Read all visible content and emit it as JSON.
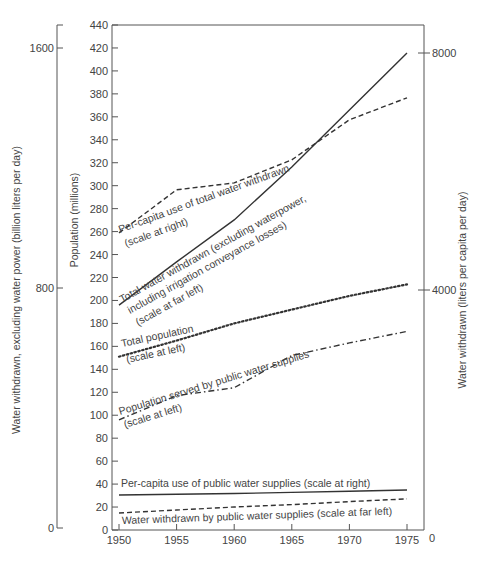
{
  "chart_data": {
    "type": "line",
    "title": "",
    "x": [
      1950,
      1955,
      1960,
      1965,
      1970,
      1975
    ],
    "xlabel": "",
    "axes": {
      "far_left": {
        "label": "Water withdrawn, excluding water power (billion liters per day)",
        "ticks": [
          0,
          800,
          1600
        ],
        "range": [
          0,
          1600
        ]
      },
      "left": {
        "label": "Population (millions)",
        "ticks": [
          0,
          20,
          40,
          60,
          80,
          100,
          120,
          140,
          160,
          180,
          200,
          220,
          240,
          260,
          280,
          300,
          320,
          340,
          360,
          380,
          400,
          420,
          440
        ],
        "range": [
          0,
          440
        ]
      },
      "right": {
        "label": "Water withdrawn (liters per capita per day)",
        "ticks": [
          0,
          4000,
          8000
        ],
        "range": [
          0,
          8000
        ]
      },
      "x_ticks": [
        "1950",
        "1955",
        "1960",
        "1965",
        "1970",
        "1975"
      ]
    },
    "grid": false,
    "series": [
      {
        "name": "Total water withdrawn (excluding waterpower, including irrigation conveyance losses)",
        "scale": "far_left",
        "style": "solid",
        "values": [
          743,
          887,
          1027,
          1203,
          1393,
          1583
        ],
        "label_lines": [
          "Total water withdrawn (excluding waterpower,",
          "including irrigation conveyance losses)",
          "(scale at far left)"
        ]
      },
      {
        "name": "Per-capita use of total water withdrawn",
        "scale": "right",
        "style": "dashed",
        "values": [
          4983,
          5705,
          5822,
          6208,
          6879,
          7248
        ],
        "label_lines": [
          "Per-capita use of total water  withdrawn",
          "(scale at right)"
        ]
      },
      {
        "name": "Total population",
        "scale": "left",
        "style": "dotted",
        "values": [
          151,
          165,
          180,
          192,
          204,
          214
        ],
        "label_lines": [
          "Total population",
          "(scale at left)"
        ]
      },
      {
        "name": "Population served by public water supplies",
        "scale": "left",
        "style": "dash-dot",
        "values": [
          96,
          117,
          124,
          152,
          163,
          173
        ],
        "label_lines": [
          "Population served by public water supplies",
          "(scale at left)"
        ]
      },
      {
        "name": "Per-capita use of public water supplies",
        "scale": "right",
        "style": "solid",
        "values": [
          587,
          600,
          612,
          630,
          650,
          671
        ],
        "label_lines": [
          "Per-capita use of public water supplies (scale at right)"
        ]
      },
      {
        "name": "Water withdrawn by public water supplies",
        "scale": "far_left",
        "style": "dashed",
        "values": [
          50,
          60,
          70,
          78,
          88,
          97
        ],
        "label_lines": [
          "Water withdrawn by public water supplies (scale at far left)"
        ]
      }
    ]
  }
}
